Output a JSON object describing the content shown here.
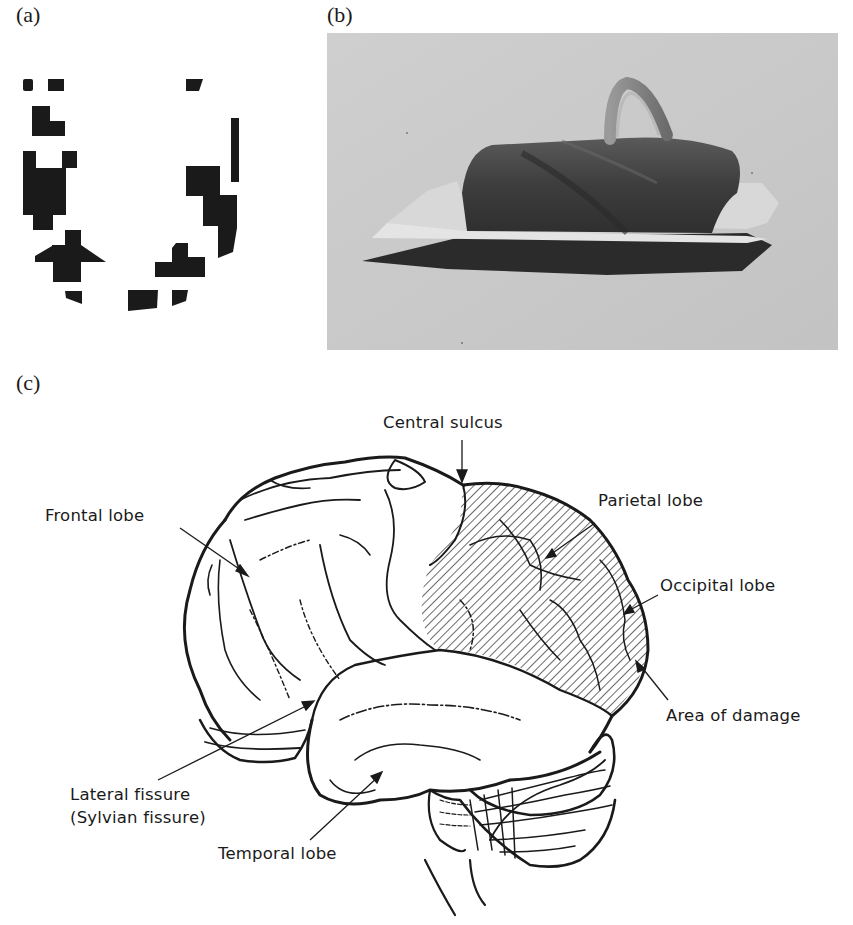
{
  "figure": {
    "panels": [
      {
        "id": "a",
        "label": "(a)",
        "description": "Pixelated binary block pattern forming an oval / face-like contour"
      },
      {
        "id": "b",
        "label": "(b)",
        "description": "Grayscale photograph of a dark hat-like object with a handle on a light background"
      },
      {
        "id": "c",
        "label": "(c)",
        "description": "Lateral view line drawing of the human brain with hatched area of damage"
      }
    ]
  },
  "brain_diagram": {
    "labels": {
      "central_sulcus": "Central sulcus",
      "frontal_lobe": "Frontal lobe",
      "parietal_lobe": "Parietal lobe",
      "occipital_lobe": "Occipital lobe",
      "area_of_damage": "Area of damage",
      "lateral_fissure": "Lateral fissure",
      "sylvian_fissure": "(Sylvian fissure)",
      "temporal_lobe": "Temporal lobe"
    }
  },
  "colors": {
    "ink": "#1a1a1a",
    "photo_background": "#c9c9c9",
    "photo_object": "#3a3a3a",
    "page": "#ffffff"
  }
}
